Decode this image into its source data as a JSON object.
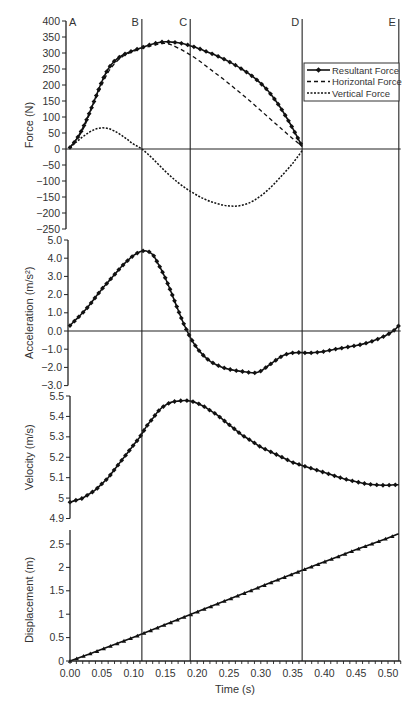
{
  "chart_data": {
    "type": "line",
    "xlabel": "Time (s)",
    "x_ticks": [
      "0.00",
      "0.05",
      "0.10",
      "0.15",
      "0.20",
      "0.25",
      "0.30",
      "0.35",
      "0.40",
      "0.45",
      "0.50"
    ],
    "xlim": [
      0,
      0.52
    ],
    "markers": [
      {
        "label": "A",
        "t": 0.0
      },
      {
        "label": "B",
        "t": 0.113
      },
      {
        "label": "C",
        "t": 0.189
      },
      {
        "label": "D",
        "t": 0.365
      },
      {
        "label": "E",
        "t": 0.517
      }
    ],
    "panels": [
      {
        "id": "force",
        "ylabel": "Force (N)",
        "ylim": [
          -250,
          400
        ],
        "y_ticks": [
          "400",
          "350",
          "300",
          "250",
          "200",
          "150",
          "100",
          "50",
          "0",
          "−50",
          "−100",
          "−150",
          "−200",
          "−250"
        ],
        "legend": [
          "Resultant Force",
          "Horizontal Force",
          "Vertical Force"
        ],
        "series": [
          {
            "name": "Resultant Force",
            "style": "solid-marker",
            "t": [
              0,
              0.01,
              0.02,
              0.03,
              0.04,
              0.05,
              0.06,
              0.07,
              0.08,
              0.09,
              0.1,
              0.11,
              0.12,
              0.13,
              0.14,
              0.15,
              0.16,
              0.17,
              0.18,
              0.19,
              0.2,
              0.21,
              0.22,
              0.23,
              0.24,
              0.25,
              0.26,
              0.27,
              0.28,
              0.29,
              0.3,
              0.31,
              0.32,
              0.33,
              0.34,
              0.35,
              0.365
            ],
            "values": [
              5,
              30,
              65,
              110,
              160,
              210,
              250,
              275,
              290,
              300,
              308,
              315,
              322,
              328,
              333,
              335,
              334,
              332,
              328,
              322,
              316,
              308,
              300,
              292,
              283,
              273,
              262,
              250,
              237,
              222,
              205,
              185,
              160,
              132,
              100,
              65,
              8
            ]
          },
          {
            "name": "Horizontal Force",
            "style": "dashed",
            "t": [
              0,
              0.02,
              0.04,
              0.06,
              0.08,
              0.1,
              0.12,
              0.14,
              0.15,
              0.16,
              0.18,
              0.2,
              0.22,
              0.24,
              0.26,
              0.28,
              0.3,
              0.32,
              0.34,
              0.365
            ],
            "values": [
              5,
              60,
              155,
              240,
              285,
              305,
              318,
              328,
              330,
              325,
              305,
              280,
              250,
              220,
              188,
              155,
              120,
              85,
              50,
              8
            ]
          },
          {
            "name": "Vertical Force",
            "style": "dotted",
            "t": [
              0,
              0.01,
              0.02,
              0.03,
              0.04,
              0.05,
              0.06,
              0.07,
              0.08,
              0.09,
              0.1,
              0.113,
              0.13,
              0.15,
              0.17,
              0.19,
              0.21,
              0.23,
              0.25,
              0.27,
              0.29,
              0.31,
              0.33,
              0.35,
              0.365
            ],
            "values": [
              5,
              22,
              38,
              52,
              62,
              66,
              64,
              56,
              44,
              30,
              15,
              0,
              -30,
              -70,
              -105,
              -133,
              -155,
              -170,
              -178,
              -176,
              -160,
              -130,
              -90,
              -45,
              -5
            ]
          }
        ]
      },
      {
        "id": "acceleration",
        "ylabel": "Acceleration (m/s²)",
        "ylim": [
          -3.0,
          5.0
        ],
        "y_ticks": [
          "5.0",
          "4.0",
          "3.0",
          "2.0",
          "1.0",
          "0.0",
          "−1.0",
          "−2.0",
          "−3.0"
        ],
        "series": [
          {
            "name": "Acceleration",
            "style": "solid-marker",
            "t": [
              0,
              0.01,
              0.02,
              0.03,
              0.04,
              0.05,
              0.06,
              0.07,
              0.08,
              0.09,
              0.1,
              0.11,
              0.12,
              0.13,
              0.14,
              0.15,
              0.16,
              0.17,
              0.18,
              0.19,
              0.2,
              0.21,
              0.22,
              0.23,
              0.24,
              0.25,
              0.26,
              0.27,
              0.28,
              0.29,
              0.3,
              0.31,
              0.32,
              0.33,
              0.34,
              0.35,
              0.36,
              0.37,
              0.38,
              0.39,
              0.4,
              0.41,
              0.42,
              0.43,
              0.44,
              0.45,
              0.46,
              0.47,
              0.48,
              0.49,
              0.5,
              0.51,
              0.517
            ],
            "values": [
              0.3,
              0.65,
              1.0,
              1.4,
              1.85,
              2.3,
              2.7,
              3.1,
              3.5,
              3.85,
              4.15,
              4.35,
              4.4,
              4.2,
              3.6,
              2.9,
              2.05,
              1.15,
              0.3,
              -0.4,
              -0.95,
              -1.35,
              -1.65,
              -1.85,
              -2.0,
              -2.1,
              -2.17,
              -2.22,
              -2.27,
              -2.3,
              -2.2,
              -1.95,
              -1.7,
              -1.45,
              -1.28,
              -1.2,
              -1.18,
              -1.2,
              -1.2,
              -1.17,
              -1.12,
              -1.05,
              -0.98,
              -0.92,
              -0.86,
              -0.8,
              -0.72,
              -0.62,
              -0.5,
              -0.35,
              -0.18,
              0.05,
              0.3
            ]
          }
        ]
      },
      {
        "id": "velocity",
        "ylabel": "Velocity (m/s)",
        "ylim": [
          4.9,
          5.5
        ],
        "y_ticks": [
          "5.5",
          "5.4",
          "5.3",
          "5.2",
          "5.1",
          "5",
          "4.9"
        ],
        "series": [
          {
            "name": "Velocity",
            "style": "solid-marker",
            "t": [
              0,
              0.01,
              0.02,
              0.03,
              0.04,
              0.05,
              0.06,
              0.07,
              0.08,
              0.09,
              0.1,
              0.11,
              0.12,
              0.13,
              0.14,
              0.15,
              0.16,
              0.17,
              0.18,
              0.19,
              0.2,
              0.21,
              0.22,
              0.23,
              0.24,
              0.25,
              0.26,
              0.27,
              0.28,
              0.29,
              0.3,
              0.31,
              0.32,
              0.33,
              0.34,
              0.35,
              0.36,
              0.37,
              0.38,
              0.39,
              0.4,
              0.41,
              0.42,
              0.43,
              0.44,
              0.45,
              0.46,
              0.47,
              0.48,
              0.49,
              0.5,
              0.51,
              0.517
            ],
            "values": [
              4.98,
              4.99,
              5.0,
              5.02,
              5.04,
              5.07,
              5.1,
              5.14,
              5.18,
              5.22,
              5.26,
              5.3,
              5.35,
              5.39,
              5.43,
              5.455,
              5.47,
              5.475,
              5.478,
              5.475,
              5.465,
              5.45,
              5.43,
              5.41,
              5.385,
              5.36,
              5.335,
              5.31,
              5.29,
              5.27,
              5.25,
              5.235,
              5.22,
              5.205,
              5.19,
              5.175,
              5.165,
              5.155,
              5.145,
              5.135,
              5.125,
              5.115,
              5.105,
              5.095,
              5.087,
              5.08,
              5.073,
              5.068,
              5.065,
              5.063,
              5.063,
              5.065,
              5.065
            ]
          }
        ]
      },
      {
        "id": "displacement",
        "ylabel": "Displacement (m)",
        "ylim": [
          0,
          2.75
        ],
        "y_ticks": [
          "2.5",
          "2",
          "1.5",
          "1",
          "0.5",
          "0"
        ],
        "series": [
          {
            "name": "Displacement",
            "style": "solid-marker",
            "t": [
              0,
              0.05,
              0.1,
              0.15,
              0.2,
              0.25,
              0.3,
              0.35,
              0.4,
              0.45,
              0.5,
              0.517
            ],
            "values": [
              0,
              0.25,
              0.51,
              0.78,
              1.05,
              1.32,
              1.59,
              1.86,
              2.12,
              2.38,
              2.63,
              2.72
            ]
          }
        ]
      }
    ]
  }
}
